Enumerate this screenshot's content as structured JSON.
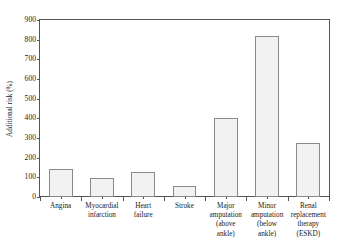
{
  "chart_data": {
    "type": "bar",
    "title": "",
    "xlabel": "",
    "ylabel": "Additional risk (%)",
    "categories": [
      "Angina",
      "Myocardial infarction",
      "Heart failure",
      "Stroke",
      "Major amputation (above ankle)",
      "Minor amputation (below ankle)",
      "Renal replacement therapy (ESKD)"
    ],
    "category_lines": [
      [
        "Angina"
      ],
      [
        "Myocardial",
        "infarction"
      ],
      [
        "Heart",
        "failure"
      ],
      [
        "Stroke"
      ],
      [
        "Major",
        "amputation",
        "(above",
        "ankle)"
      ],
      [
        "Minor",
        "amputation",
        "(below",
        "ankle)"
      ],
      [
        "Renal",
        "replacement",
        "therapy",
        "(ESKD)"
      ]
    ],
    "values": [
      140,
      95,
      125,
      55,
      400,
      820,
      275
    ],
    "ylim": [
      0,
      900
    ],
    "ytick_values": [
      0,
      100,
      200,
      300,
      400,
      500,
      600,
      700,
      800,
      900
    ],
    "ytick_labels": [
      "0",
      "100",
      "200",
      "300",
      "400",
      "500",
      "600",
      "700",
      "800",
      "900"
    ],
    "grid": false,
    "legend": null,
    "legend_position": "none",
    "bar_fill_color": "#f2f2f2",
    "bar_edge_color": "#8a8a8a",
    "axis_color": "#555555",
    "background_color": "#ffffff"
  }
}
